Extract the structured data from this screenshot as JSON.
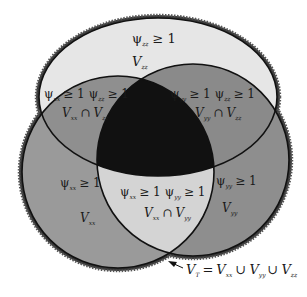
{
  "diagram": {
    "type": "venn",
    "colors": {
      "background": "#ffffff",
      "zz_only": "#e6e6e6",
      "pair_overlap_top": "#8c8c8c",
      "xx_only": "#9a9a9a",
      "yy_only": "#8e8e8e",
      "xx_yy_overlap": "#d4d4d4",
      "triple_overlap": "#111111",
      "outline": "#111111",
      "union_border": "#3a3a3a"
    },
    "regions": {
      "zz_only": {
        "line1": "ψ",
        "line1_sub": "zz",
        "line1_rel": "≥ 1",
        "line2": "V",
        "line2_sub": "zz"
      },
      "xx_zz": {
        "cond_a": "ψ",
        "cond_a_sub": "xx",
        "cond_a_rel": "≥ 1",
        "cond_b": "ψ",
        "cond_b_sub": "zz",
        "cond_b_rel": "≥ 1",
        "set_a": "V",
        "set_a_sub": "xx",
        "op": "∩",
        "set_b": "V",
        "set_b_sub": "zz"
      },
      "yy_zz": {
        "cond_a": "ψ",
        "cond_a_sub": "yy",
        "cond_a_rel": "≥ 1",
        "cond_b": "ψ",
        "cond_b_sub": "zz",
        "cond_b_rel": "≥ 1",
        "set_a": "V",
        "set_a_sub": "yy",
        "op": "∩",
        "set_b": "V",
        "set_b_sub": "zz"
      },
      "xx_only": {
        "line1": "ψ",
        "line1_sub": "xx",
        "line1_rel": "≥ 1",
        "line2": "V",
        "line2_sub": "xx"
      },
      "yy_only": {
        "line1": "ψ",
        "line1_sub": "yy",
        "line1_rel": "≥ 1",
        "line2": "V",
        "line2_sub": "yy"
      },
      "xx_yy": {
        "cond_a": "ψ",
        "cond_a_sub": "xx",
        "cond_a_rel": "≥ 1",
        "cond_b": "ψ",
        "cond_b_sub": "yy",
        "cond_b_rel": "≥ 1",
        "set_a": "V",
        "set_a_sub": "xx",
        "op": "∩",
        "set_b": "V",
        "set_b_sub": "yy"
      }
    },
    "union_label": {
      "lhs": "V",
      "lhs_sub": "T",
      "eq": "=",
      "t1": "V",
      "t1_sub": "xx",
      "u1": "∪",
      "t2": "V",
      "t2_sub": "yy",
      "u2": "∪",
      "t3": "V",
      "t3_sub": "zz"
    }
  }
}
